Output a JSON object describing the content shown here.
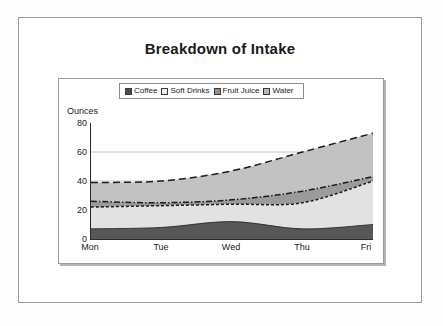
{
  "slide": {
    "title": "Breakdown of Intake"
  },
  "chart_data": {
    "type": "area",
    "title": "Breakdown of Intake",
    "subtitle": "",
    "xlabel": "",
    "ylabel": "Ounces",
    "categories": [
      "Mon",
      "Tue",
      "Wed",
      "Thu",
      "Fri"
    ],
    "x_tick_labels": [
      "Mon",
      "Tue",
      "Wed",
      "Thu",
      "Fri"
    ],
    "y_tick_labels": [
      "0",
      "20",
      "40",
      "60",
      "80"
    ],
    "ylim": [
      0,
      80
    ],
    "y_ticks": [
      0,
      20,
      40,
      60,
      80
    ],
    "grid": "horizontal",
    "stacked": true,
    "legend_position": "top-center",
    "series": [
      {
        "name": "Coffee",
        "values": [
          7,
          8,
          12,
          7,
          10
        ],
        "cumulative": [
          7,
          8,
          12,
          7,
          10
        ],
        "color": "#575757",
        "swatch": "#4a4a4a",
        "line_style": "solid"
      },
      {
        "name": "Soft Drinks",
        "values": [
          15,
          15,
          12,
          18,
          30
        ],
        "cumulative": [
          22,
          23,
          24,
          25,
          40
        ],
        "color": "#e2e2e2",
        "swatch": "#ededed",
        "line_style": "dashed-fine"
      },
      {
        "name": "Fruit Juice",
        "values": [
          4,
          2,
          3,
          8,
          3
        ],
        "cumulative": [
          26,
          25,
          27,
          33,
          43
        ],
        "color": "#9b9b9b",
        "swatch": "#8f8f8f",
        "line_style": "dash-dot"
      },
      {
        "name": "Water",
        "values": [
          13,
          15,
          20,
          27,
          30
        ],
        "cumulative": [
          39,
          40,
          47,
          60,
          73
        ],
        "color": "#c2c2c2",
        "swatch": "#b6b6b6",
        "line_style": "long-dash"
      }
    ]
  },
  "legend": {
    "items": [
      {
        "label": "Coffee"
      },
      {
        "label": "Soft Drinks"
      },
      {
        "label": "Fruit Juice"
      },
      {
        "label": "Water"
      }
    ]
  },
  "colors": {
    "coffee": "#575757",
    "soft_drinks": "#e2e2e2",
    "fruit_juice": "#9b9b9b",
    "water": "#c2c2c2",
    "axis": "#2b2b2b",
    "grid": "#c8c8c8",
    "frame": "#9a9a9a"
  }
}
